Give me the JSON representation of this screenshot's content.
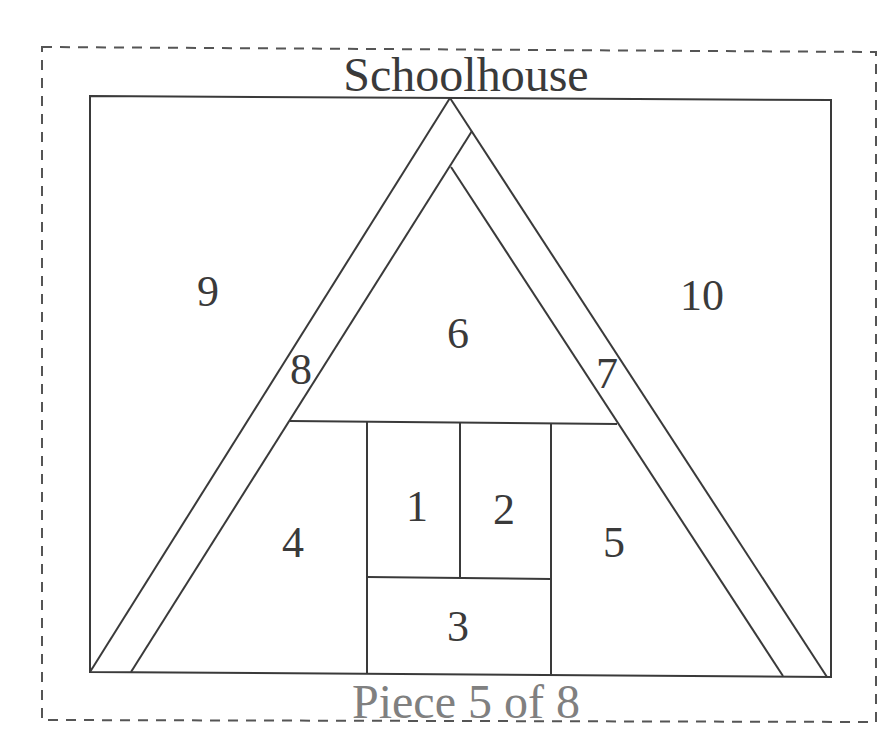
{
  "diagram": {
    "title": "Schoolhouse",
    "footer": "Piece 5 of 8",
    "colors": {
      "line": "#3a3a3a",
      "dashed_border": "#555555",
      "title_text": "#3a3a3a",
      "footer_text": "#808080",
      "background": "#ffffff"
    },
    "pieces": [
      {
        "id": "1",
        "label": "1",
        "x": 417,
        "y": 507
      },
      {
        "id": "2",
        "label": "2",
        "x": 504,
        "y": 510
      },
      {
        "id": "3",
        "label": "3",
        "x": 458,
        "y": 627
      },
      {
        "id": "4",
        "label": "4",
        "x": 293,
        "y": 543
      },
      {
        "id": "5",
        "label": "5",
        "x": 614,
        "y": 543
      },
      {
        "id": "6",
        "label": "6",
        "x": 458,
        "y": 334
      },
      {
        "id": "7",
        "label": "7",
        "x": 607,
        "y": 374
      },
      {
        "id": "8",
        "label": "8",
        "x": 301,
        "y": 370
      },
      {
        "id": "9",
        "label": "9",
        "x": 208,
        "y": 292
      },
      {
        "id": "10",
        "label": "10",
        "x": 702,
        "y": 296
      }
    ]
  }
}
